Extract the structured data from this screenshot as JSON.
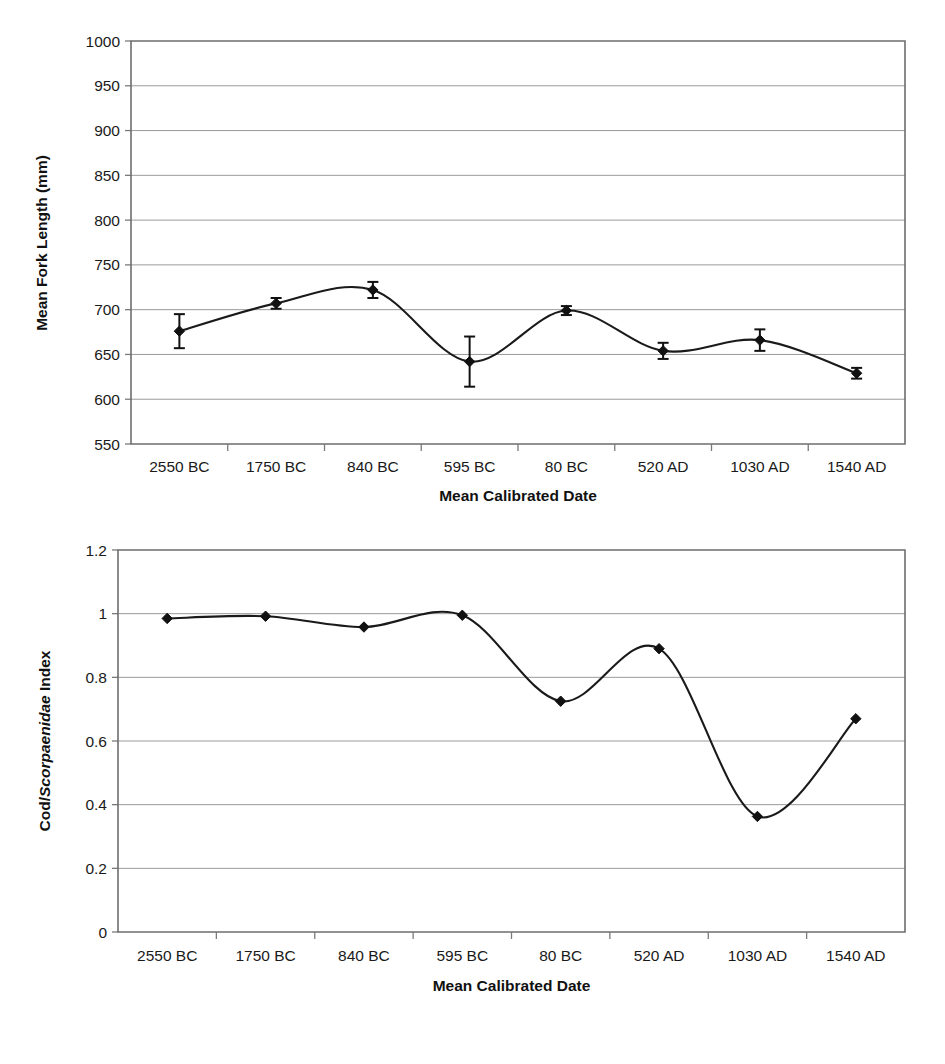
{
  "figure": {
    "panels": [
      "top",
      "bottom"
    ]
  },
  "chart_data": [
    {
      "id": "mean-fork-length",
      "type": "line",
      "title": "",
      "xlabel": "Mean Calibrated Date",
      "ylabel": "Mean Fork Length (mm)",
      "ylabel_parts": [
        {
          "text": "Mean Fork Length (mm)",
          "style": "normal"
        }
      ],
      "categories": [
        "2550 BC",
        "1750 BC",
        "840 BC",
        "595 BC",
        "80 BC",
        "520 AD",
        "1030 AD",
        "1540 AD"
      ],
      "values": [
        676,
        707,
        722,
        642,
        699,
        654,
        666,
        629
      ],
      "error_upper": [
        19,
        6,
        9,
        28,
        5,
        9,
        12,
        6
      ],
      "error_lower": [
        19,
        6,
        9,
        28,
        5,
        9,
        12,
        6
      ],
      "ylim": [
        550,
        1000
      ],
      "yticks": [
        550,
        600,
        650,
        700,
        750,
        800,
        850,
        900,
        950,
        1000
      ],
      "ytick_labels": [
        "550",
        "600",
        "650",
        "700",
        "750",
        "800",
        "850",
        "900",
        "950",
        "1000"
      ],
      "grid": true,
      "legend": "none",
      "marker": "diamond",
      "smoothing": "spline",
      "error_bars": true
    },
    {
      "id": "cod-scorpaenidae-index",
      "type": "line",
      "title": "",
      "xlabel": "Mean Calibrated Date",
      "ylabel": "Cod/Scorpaenidae Index",
      "ylabel_parts": [
        {
          "text": "Cod/",
          "style": "normal"
        },
        {
          "text": "Scorpaenidae",
          "style": "italic"
        },
        {
          "text": " Index",
          "style": "normal"
        }
      ],
      "categories": [
        "2550 BC",
        "1750 BC",
        "840 BC",
        "595 BC",
        "80 BC",
        "520 AD",
        "1030 AD",
        "1540 AD"
      ],
      "values": [
        0.985,
        0.992,
        0.958,
        0.995,
        0.725,
        0.89,
        0.363,
        0.67
      ],
      "ylim": [
        0,
        1.2
      ],
      "yticks": [
        0,
        0.2,
        0.4,
        0.6,
        0.8,
        1,
        1.2
      ],
      "ytick_labels": [
        "0",
        "0.2",
        "0.4",
        "0.6",
        "0.8",
        "1",
        "1.2"
      ],
      "grid": true,
      "legend": "none",
      "marker": "diamond",
      "smoothing": "spline",
      "error_bars": false
    }
  ]
}
